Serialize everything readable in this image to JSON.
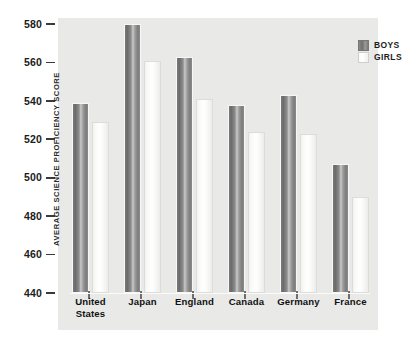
{
  "top_remnant": "",
  "chart_data": {
    "type": "bar",
    "title": "",
    "xlabel": "",
    "ylabel": "AVERAGE SCIENCE PROFICIENCY SCORE",
    "ylim": [
      440,
      580
    ],
    "ytick_values": [
      580,
      560,
      540,
      520,
      500,
      480,
      460,
      440
    ],
    "ytick_labels": [
      "580",
      "560",
      "540",
      "520",
      "500",
      "480",
      "460",
      "440"
    ],
    "grid": false,
    "legend_position": "top-right",
    "categories": [
      "United States",
      "Japan",
      "England",
      "Canada",
      "Germany",
      "France"
    ],
    "category_labels": [
      [
        "United",
        "States"
      ],
      [
        "Japan"
      ],
      [
        "England"
      ],
      [
        "Canada"
      ],
      [
        "Germany"
      ],
      [
        "France"
      ]
    ],
    "series": [
      {
        "name": "BOYS",
        "color": "#7f7f7f",
        "values": [
          539,
          580,
          563,
          538,
          543,
          507
        ]
      },
      {
        "name": "GIRLS",
        "color": "#ffffff",
        "values": [
          529,
          561,
          541,
          524,
          523,
          490
        ]
      }
    ]
  },
  "legend": {
    "items": [
      {
        "label": "BOYS",
        "swatch": "boys-swatch"
      },
      {
        "label": "GIRLS",
        "swatch": "girls-swatch"
      }
    ]
  },
  "colors": {
    "panel_background": "#e9e9e7",
    "page_background": "#ffffff",
    "boys_bar": "#7f7f7f",
    "girls_bar": "#ffffff",
    "tick_mark": "#3a3a3a",
    "text": "#1b1b1b"
  }
}
